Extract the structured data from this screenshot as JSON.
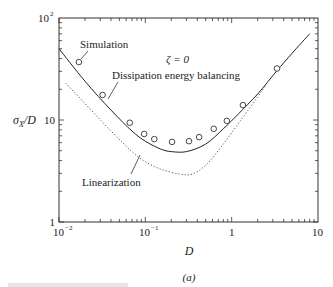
{
  "chart_data": {
    "type": "line",
    "title": "",
    "subtitle": "(a)",
    "xlabel": "D",
    "ylabel": "σX/D",
    "xscale": "log",
    "yscale": "log",
    "xlim": [
      0.01,
      10
    ],
    "ylim": [
      1,
      100
    ],
    "x_ticks": [
      "10^-2",
      "10^-1",
      "1",
      "10"
    ],
    "y_ticks": [
      "1",
      "10",
      "10^2"
    ],
    "grid": false,
    "annotation": "ζ = 0",
    "series": [
      {
        "name": "Simulation",
        "style": "markers",
        "marker": "open-circle",
        "x": [
          0.017,
          0.032,
          0.066,
          0.097,
          0.127,
          0.204,
          0.32,
          0.42,
          0.62,
          0.88,
          1.35,
          3.35
        ],
        "y": [
          37,
          17.6,
          9.4,
          7.3,
          6.5,
          6.1,
          6.2,
          6.8,
          8.2,
          9.8,
          14,
          32
        ]
      },
      {
        "name": "Dissipation energy balancing",
        "style": "solid",
        "x": [
          0.01,
          0.02,
          0.04,
          0.07,
          0.1,
          0.15,
          0.2,
          0.3,
          0.5,
          0.8,
          1.2,
          2,
          3.3,
          5,
          8
        ],
        "y": [
          50,
          24,
          12.5,
          7.8,
          6.2,
          5.2,
          4.9,
          4.9,
          5.8,
          8.2,
          11.5,
          18,
          30,
          45,
          70
        ]
      },
      {
        "name": "Linearization",
        "style": "dotted",
        "x": [
          0.012,
          0.02,
          0.04,
          0.07,
          0.1,
          0.15,
          0.25,
          0.35,
          0.5,
          0.7,
          1.0,
          1.5,
          2.5
        ],
        "y": [
          23,
          14.5,
          7.8,
          4.9,
          3.9,
          3.3,
          2.95,
          2.95,
          3.6,
          5.0,
          7.5,
          12,
          22
        ]
      }
    ],
    "labels": {
      "simulation": "Simulation",
      "dissipation": "Dissipation energy balancing",
      "linearization": "Linearization",
      "zeta": "ζ = 0"
    }
  },
  "axes": {
    "xlabel": "D",
    "ylabel_main": "σ",
    "ylabel_sub": "X",
    "ylabel_tail": "/D",
    "x_tick_labels": [
      {
        "base": "10",
        "exp": "−2"
      },
      {
        "base": "10",
        "exp": "−1"
      },
      {
        "base": "1",
        "exp": ""
      },
      {
        "base": "10",
        "exp": ""
      }
    ],
    "y_tick_labels": [
      {
        "base": "1",
        "exp": ""
      },
      {
        "base": "10",
        "exp": ""
      },
      {
        "base": "10",
        "exp": "2"
      }
    ]
  },
  "caption": "(a)",
  "colors": {
    "line": "#222222",
    "dotted": "#555555",
    "frame": "#333333"
  }
}
